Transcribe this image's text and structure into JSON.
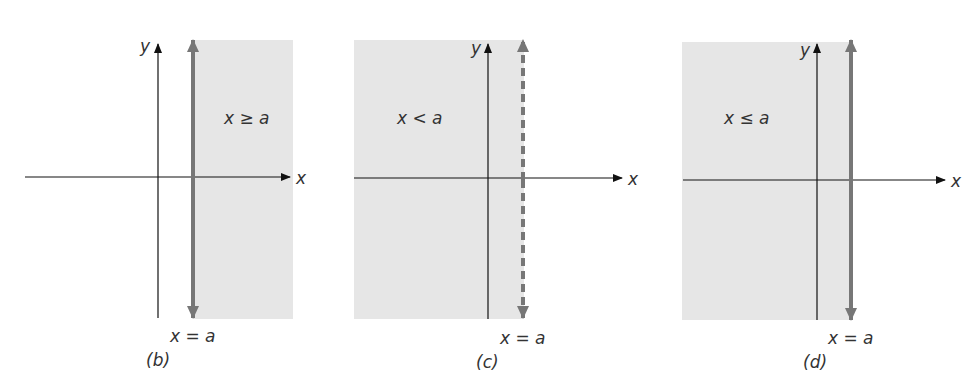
{
  "colors": {
    "shade": "#e6e6e6",
    "boundary": "#777777",
    "axis": "#111111",
    "text": "#333333"
  },
  "panels": [
    {
      "id": "b",
      "caption": "(b)",
      "region_label": "x ≥ a",
      "boundary_label": "x = a",
      "x_axis_label": "x",
      "y_axis_label": "y",
      "shaded_side": "right",
      "boundary_style": "solid"
    },
    {
      "id": "c",
      "caption": "(c)",
      "region_label": "x < a",
      "boundary_label": "x = a",
      "x_axis_label": "x",
      "y_axis_label": "y",
      "shaded_side": "left",
      "boundary_style": "dashed"
    },
    {
      "id": "d",
      "caption": "(d)",
      "region_label": "x ≤ a",
      "boundary_label": "x = a",
      "x_axis_label": "x",
      "y_axis_label": "y",
      "shaded_side": "left",
      "boundary_style": "solid"
    }
  ]
}
